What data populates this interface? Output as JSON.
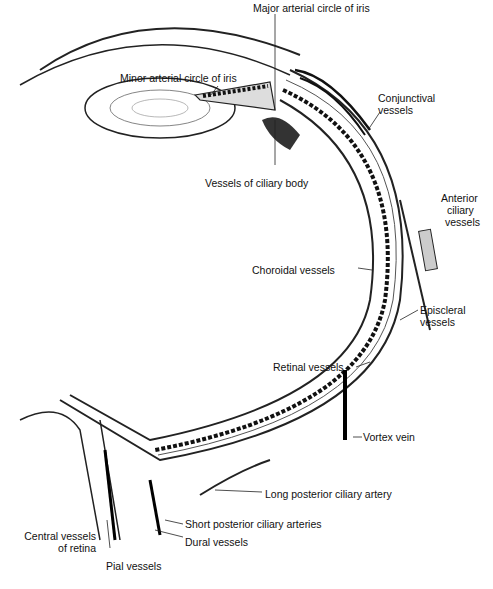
{
  "diagram": {
    "labels": {
      "major_arterial_circle": "Major arterial circle of iris",
      "minor_arterial_circle": "Minor arterial circle of iris",
      "conjunctival_1": "Conjunctival",
      "conjunctival_2": "vessels",
      "ciliary_body": "Vessels of ciliary body",
      "anterior_ciliary_1": "Anterior",
      "anterior_ciliary_2": "ciliary",
      "anterior_ciliary_3": "vessels",
      "choroidal": "Choroidal vessels",
      "episcleral_1": "Episcleral",
      "episcleral_2": "vessels",
      "retinal": "Retinal vessels",
      "vortex": "Vortex vein",
      "long_posterior": "Long posterior ciliary artery",
      "short_posterior": "Short posterior ciliary arteries",
      "central_1": "Central vessels",
      "central_2": "of retina",
      "dural": "Dural vessels",
      "pial": "Pial vessels"
    }
  }
}
